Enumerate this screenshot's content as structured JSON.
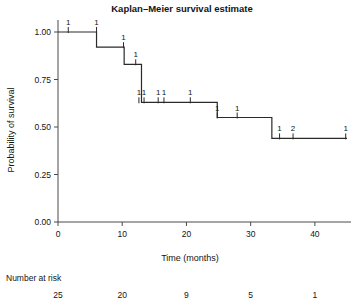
{
  "chart_data": {
    "type": "line",
    "subtype": "kaplan-meier-step",
    "title": "Kaplan–Meier survival estimate",
    "xlabel": "Time (months)",
    "ylabel": "Probability of survival",
    "xlim": [
      0,
      45
    ],
    "ylim": [
      0,
      1.0
    ],
    "grid": false,
    "legend": null,
    "xticks": [
      0,
      10,
      20,
      30,
      40
    ],
    "xticklabels": [
      "0",
      "10",
      "20",
      "30",
      "40"
    ],
    "yticks": [
      0.0,
      0.25,
      0.5,
      0.75,
      1.0
    ],
    "yticklabels": [
      "0.00",
      "0.25",
      "0.50",
      "0.75",
      "1.00"
    ],
    "series": [
      {
        "name": "survival",
        "step_points": [
          {
            "t": 0.0,
            "s": 1.0
          },
          {
            "t": 6.0,
            "s": 1.0
          },
          {
            "t": 6.0,
            "s": 0.92
          },
          {
            "t": 10.3,
            "s": 0.92
          },
          {
            "t": 10.3,
            "s": 0.83
          },
          {
            "t": 13.0,
            "s": 0.83
          },
          {
            "t": 13.0,
            "s": 0.63
          },
          {
            "t": 24.8,
            "s": 0.63
          },
          {
            "t": 24.8,
            "s": 0.55
          },
          {
            "t": 33.3,
            "s": 0.55
          },
          {
            "t": 33.3,
            "s": 0.44
          },
          {
            "t": 45.0,
            "s": 0.44
          }
        ]
      }
    ],
    "censored": [
      {
        "t": 1.6,
        "s": 1.0,
        "label": "1"
      },
      {
        "t": 6.0,
        "s": 1.0,
        "label": "1"
      },
      {
        "t": 10.2,
        "s": 0.92,
        "label": "1"
      },
      {
        "t": 12.1,
        "s": 0.83,
        "label": "1"
      },
      {
        "t": 12.6,
        "s": 0.63,
        "label": "1"
      },
      {
        "t": 13.4,
        "s": 0.63,
        "label": "1"
      },
      {
        "t": 15.6,
        "s": 0.63,
        "label": "1"
      },
      {
        "t": 16.5,
        "s": 0.63,
        "label": "1"
      },
      {
        "t": 20.6,
        "s": 0.63,
        "label": "1"
      },
      {
        "t": 24.8,
        "s": 0.55,
        "label": "1"
      },
      {
        "t": 27.9,
        "s": 0.55,
        "label": "1"
      },
      {
        "t": 34.5,
        "s": 0.44,
        "label": "1"
      },
      {
        "t": 36.6,
        "s": 0.44,
        "label": "2"
      },
      {
        "t": 44.8,
        "s": 0.44,
        "label": "1"
      }
    ],
    "number_at_risk": {
      "title": "Number at risk",
      "times": [
        0,
        10,
        20,
        30,
        40
      ],
      "values": [
        "25",
        "20",
        "9",
        "5",
        "1"
      ]
    }
  },
  "colors": {
    "curve": "#2a2a2a",
    "axis": "#4a4a4a",
    "text": "#141414",
    "background": "#ffffff"
  }
}
